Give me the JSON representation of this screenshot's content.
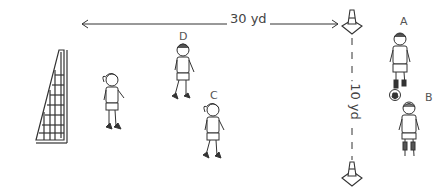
{
  "diagram": {
    "type": "soccer-drill",
    "distances": {
      "horizontal": "30 yd",
      "vertical": "10 yd"
    },
    "players": [
      {
        "label": "A",
        "has_ball": true
      },
      {
        "label": "B",
        "has_ball": false
      },
      {
        "label": "C",
        "has_ball": false
      },
      {
        "label": "D",
        "has_ball": false
      },
      {
        "label": "",
        "has_ball": false
      }
    ],
    "objects": [
      "goal",
      "cone-top",
      "cone-bottom"
    ],
    "colors": {
      "line": "#333333",
      "background": "#ffffff"
    }
  }
}
